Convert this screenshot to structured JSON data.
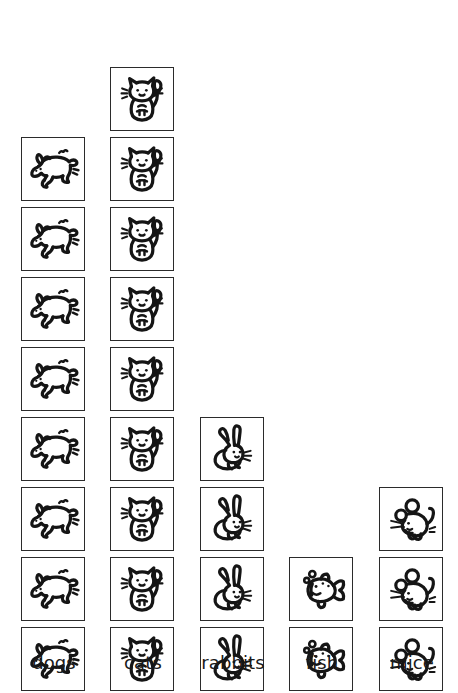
{
  "chart_data": {
    "type": "bar",
    "subtype": "pictogram",
    "title": "",
    "subtitle": "",
    "xlabel": "",
    "ylabel": "",
    "categories": [
      "dogs",
      "cats",
      "rabbits",
      "fish",
      "mice"
    ],
    "values": [
      8,
      9,
      4,
      2,
      3
    ],
    "series": [
      {
        "name": "count",
        "values": [
          8,
          9,
          4,
          2,
          3
        ]
      }
    ],
    "unit_per_icon": 1,
    "ylim": [
      0,
      9
    ],
    "grid": false,
    "legend": false,
    "legend_position": "none",
    "annotations": []
  },
  "chart": {
    "columns": [
      {
        "id": "dogs",
        "label": "dogs",
        "count": 8,
        "icon": "dog-icon",
        "left": 21
      },
      {
        "id": "cats",
        "label": "cats",
        "count": 9,
        "icon": "cat-icon",
        "left": 110
      },
      {
        "id": "rabbits",
        "label": "rabbits",
        "count": 4,
        "icon": "rabbit-icon",
        "left": 200
      },
      {
        "id": "fish",
        "label": "fish",
        "count": 2,
        "icon": "fish-icon",
        "left": 289
      },
      {
        "id": "mice",
        "label": "mice",
        "count": 3,
        "icon": "mouse-icon",
        "left": 379
      }
    ],
    "colors": {
      "background": "#ffffff",
      "cell_border": "#2b2b2b",
      "ink": "#1a1a1a",
      "label_text": "#1a1a1a"
    },
    "layout": {
      "cell_size": 66,
      "cell_pitch": 70,
      "baseline_y": 643,
      "label_y": 653
    }
  }
}
